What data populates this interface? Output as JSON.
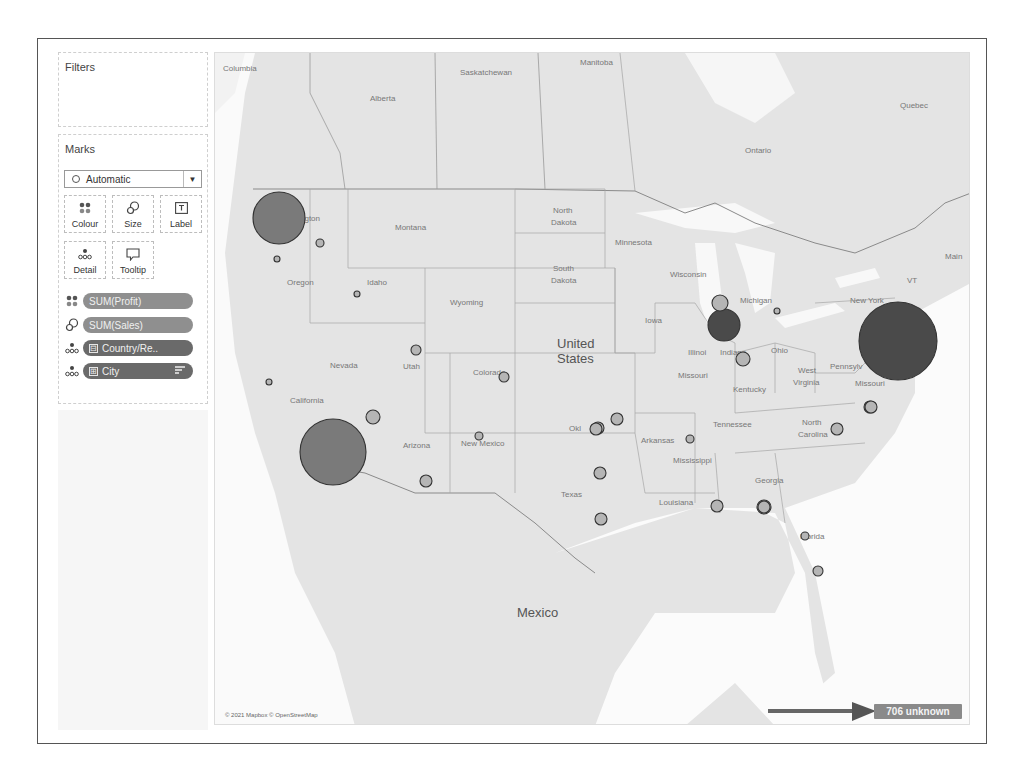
{
  "sidebar": {
    "filters": {
      "title": "Filters"
    },
    "marks": {
      "title": "Marks",
      "mark_type": {
        "selected": "Automatic",
        "icon": "circle-icon"
      },
      "buttons": [
        {
          "label": "Colour",
          "icon": "colour-icon"
        },
        {
          "label": "Size",
          "icon": "size-icon"
        },
        {
          "label": "Label",
          "icon": "label-icon"
        },
        {
          "label": "Detail",
          "icon": "detail-icon"
        },
        {
          "label": "Tooltip",
          "icon": "tooltip-icon"
        }
      ],
      "shelf": [
        {
          "icon": "colour-icon",
          "label": "SUM(Profit)",
          "type": "measure"
        },
        {
          "icon": "size-icon",
          "label": "SUM(Sales)",
          "type": "measure"
        },
        {
          "icon": "detail-icon",
          "label": "Country/Re..",
          "type": "dimension",
          "prefix": "⊟"
        },
        {
          "icon": "detail-icon",
          "label": "City",
          "type": "dimension",
          "prefix": "⊞",
          "sort": "sort-icon"
        }
      ]
    }
  },
  "map": {
    "attribution": "© 2021 Mapbox © OpenStreetMap",
    "unknown_badge": "706 unknown",
    "labels": {
      "countries": [
        "United",
        "States",
        "Mexico"
      ],
      "provinces": [
        "Columbia",
        "Alberta",
        "Saskatchewan",
        "Manitoba",
        "Ontario",
        "Quebec"
      ],
      "states": [
        "Washington",
        "Montana",
        "North Dakota",
        "Minnesota",
        "South Dakota",
        "Wisconsin",
        "Oregon",
        "Idaho",
        "Wyoming",
        "Iowa",
        "Michigan",
        "New York",
        "VT",
        "Maine",
        "Nevada",
        "Utah",
        "Colorado",
        "Illinois",
        "Indiana",
        "Ohio",
        "Pennsylvania",
        "California",
        "Missouri",
        "Kentucky",
        "West Virginia",
        "Arizona",
        "New Mexico",
        "Oklahoma",
        "Arkansas",
        "Tennessee",
        "North Carolina",
        "Mississippi",
        "Georgia",
        "Texas",
        "Louisiana",
        "Florida"
      ]
    },
    "colors": {
      "water": "#ffffff",
      "land": "#e4e4e4",
      "high_profit": "#4a4a4a",
      "mid_profit": "#7a7a7a",
      "low_profit": "#b5b5b5",
      "badge": "#8a8a8a"
    },
    "marks": [
      {
        "city": "Seattle",
        "x": 64,
        "y": 165,
        "r": 26,
        "shade": "mid"
      },
      {
        "city": "Los Angeles",
        "x": 118,
        "y": 399,
        "r": 33,
        "shade": "mid"
      },
      {
        "city": "New York City",
        "x": 683,
        "y": 288,
        "r": 39,
        "shade": "dark"
      },
      {
        "city": "Chicago",
        "x": 509,
        "y": 272,
        "r": 16,
        "shade": "dark"
      },
      {
        "city": "Chicago-area",
        "x": 505,
        "y": 250,
        "r": 8,
        "shade": "light"
      },
      {
        "city": "Indianapolis",
        "x": 528,
        "y": 306,
        "r": 7,
        "shade": "light"
      },
      {
        "city": "Philadelphia",
        "x": 655,
        "y": 354,
        "r": 6,
        "shade": "light"
      },
      {
        "city": "San Diego",
        "x": 158,
        "y": 364,
        "r": 7,
        "shade": "light"
      },
      {
        "city": "Phoenix",
        "x": 211,
        "y": 428,
        "r": 6,
        "shade": "light"
      },
      {
        "city": "Houston",
        "x": 385,
        "y": 420,
        "r": 6,
        "shade": "light"
      },
      {
        "city": "Dallas",
        "x": 383,
        "y": 375,
        "r": 6,
        "shade": "light"
      },
      {
        "city": "Oklahoma City",
        "x": 402,
        "y": 366,
        "r": 6,
        "shade": "light"
      },
      {
        "city": "Tulsa",
        "x": 381,
        "y": 376,
        "r": 6,
        "shade": "light"
      },
      {
        "city": "New Orleans",
        "x": 502,
        "y": 453,
        "r": 6,
        "shade": "light"
      },
      {
        "city": "Jacksonville",
        "x": 549,
        "y": 454,
        "r": 7,
        "shade": "light"
      },
      {
        "city": "Atlanta",
        "x": 549,
        "y": 454,
        "r": 6,
        "shade": "light"
      },
      {
        "city": "San Antonio",
        "x": 386,
        "y": 466,
        "r": 6,
        "shade": "light"
      },
      {
        "city": "Denver",
        "x": 289,
        "y": 324,
        "r": 5,
        "shade": "light"
      },
      {
        "city": "Salt Lake City",
        "x": 201,
        "y": 297,
        "r": 5,
        "shade": "light"
      },
      {
        "city": "Albuquerque",
        "x": 264,
        "y": 383,
        "r": 4,
        "shade": "light"
      },
      {
        "city": "Memphis",
        "x": 475,
        "y": 386,
        "r": 4,
        "shade": "light"
      },
      {
        "city": "Columbus",
        "x": 622,
        "y": 376,
        "r": 6,
        "shade": "light"
      },
      {
        "city": "Burlington",
        "x": 656,
        "y": 354,
        "r": 6,
        "shade": "light"
      },
      {
        "city": "Sacramento",
        "x": 54,
        "y": 329,
        "r": 3,
        "shade": "light"
      },
      {
        "city": "Portland",
        "x": 62,
        "y": 206,
        "r": 3,
        "shade": "light"
      },
      {
        "city": "Spokane",
        "x": 105,
        "y": 190,
        "r": 4,
        "shade": "light"
      },
      {
        "city": "Boise",
        "x": 142,
        "y": 241,
        "r": 3,
        "shade": "light"
      },
      {
        "city": "Miami",
        "x": 603,
        "y": 518,
        "r": 5,
        "shade": "light"
      },
      {
        "city": "Tampa",
        "x": 590,
        "y": 483,
        "r": 4,
        "shade": "light"
      },
      {
        "city": "Detroit",
        "x": 562,
        "y": 258,
        "r": 3,
        "shade": "light"
      }
    ]
  }
}
